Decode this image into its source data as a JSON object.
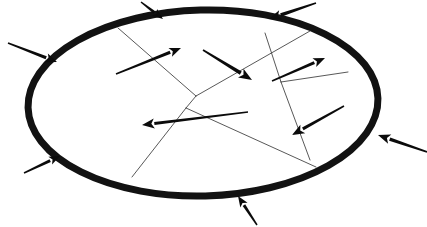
{
  "figure": {
    "background_color": "#ffffff",
    "width": 427,
    "height": 227,
    "line_color": "#121212",
    "grain_line_color": "#3a3a3a",
    "arrow_color": "#0b0b0b"
  },
  "boundary": {
    "name": "outer-ellipse",
    "shape": "ellipse",
    "center_x": 203,
    "center_y": 103,
    "radius_x": 175,
    "radius_y": 93,
    "rotation_deg": -1.5,
    "stroke_width": 7,
    "fill": "#ffffff"
  },
  "grain_lines": [
    {
      "name": "grain-line-nw-diagonal",
      "x1": 118,
      "y1": 28,
      "x2": 196,
      "y2": 96
    },
    {
      "name": "grain-line-center-long",
      "x1": 196,
      "y1": 96,
      "x2": 310,
      "y2": 31
    },
    {
      "name": "grain-line-junction-down",
      "x1": 196,
      "y1": 96,
      "x2": 186,
      "y2": 108
    },
    {
      "name": "grain-line-junction-to-bottom",
      "x1": 186,
      "y1": 108,
      "x2": 132,
      "y2": 177
    },
    {
      "name": "grain-line-junction-to-se",
      "x1": 186,
      "y1": 108,
      "x2": 316,
      "y2": 167
    },
    {
      "name": "grain-line-ne-vertical",
      "x1": 265,
      "y1": 33,
      "x2": 281,
      "y2": 82
    },
    {
      "name": "grain-line-ne-east",
      "x1": 281,
      "y1": 82,
      "x2": 348,
      "y2": 72
    },
    {
      "name": "grain-line-east-down",
      "x1": 281,
      "y1": 82,
      "x2": 310,
      "y2": 160
    }
  ],
  "external_arrows": [
    {
      "name": "external-arrow-top-left-outer",
      "label": "inward load top-left",
      "x1": 8,
      "y1": 43,
      "x2": 57,
      "y2": 62,
      "width": 2.6,
      "head": 7.5
    },
    {
      "name": "external-arrow-top-center",
      "label": "inward load top-center",
      "x1": 141,
      "y1": 2,
      "x2": 163,
      "y2": 19,
      "width": 2.4,
      "head": 7.0
    },
    {
      "name": "external-arrow-top-right",
      "label": "inward load top-right",
      "x1": 316,
      "y1": 3,
      "x2": 269,
      "y2": 19,
      "width": 2.8,
      "head": 8.0
    },
    {
      "name": "external-arrow-right",
      "label": "inward load right",
      "x1": 427,
      "y1": 152,
      "x2": 378,
      "y2": 135,
      "width": 2.8,
      "head": 8.0
    },
    {
      "name": "external-arrow-bottom-center",
      "label": "inward load bottom",
      "x1": 257,
      "y1": 225,
      "x2": 238,
      "y2": 196,
      "width": 2.4,
      "head": 7.0
    },
    {
      "name": "external-arrow-bottom-left",
      "label": "inward load bottom-left",
      "x1": 24,
      "y1": 173,
      "x2": 60,
      "y2": 156,
      "width": 2.4,
      "head": 7.0
    }
  ],
  "internal_arrows": [
    {
      "name": "internal-arrow-grain-nw",
      "label": "slip direction grain NW",
      "x1": 116,
      "y1": 74,
      "x2": 181,
      "y2": 48,
      "width": 2.6,
      "head": 7.5
    },
    {
      "name": "internal-arrow-grain-n",
      "label": "slip direction grain N",
      "x1": 203,
      "y1": 50,
      "x2": 252,
      "y2": 80,
      "width": 2.9,
      "head": 8.5
    },
    {
      "name": "internal-arrow-grain-ne",
      "label": "slip direction grain NE",
      "x1": 272,
      "y1": 81,
      "x2": 325,
      "y2": 58,
      "width": 2.6,
      "head": 7.5
    },
    {
      "name": "internal-arrow-grain-center",
      "label": "slip direction grain center",
      "x1": 248,
      "y1": 112,
      "x2": 142,
      "y2": 125,
      "width": 2.4,
      "head": 8.0
    },
    {
      "name": "internal-arrow-grain-se",
      "label": "slip direction grain SE",
      "x1": 344,
      "y1": 106,
      "x2": 292,
      "y2": 135,
      "width": 2.6,
      "head": 8.0
    }
  ],
  "legend": {
    "visible": false,
    "items": []
  }
}
